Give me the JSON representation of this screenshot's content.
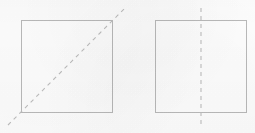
{
  "figure": {
    "caption": "",
    "canvas": {
      "width": 255,
      "height": 133,
      "background_color": "#fdfdfd"
    },
    "style": {
      "shape_stroke_color": "#b9b9b9",
      "shape_stroke_width": 1,
      "symmetry_stroke_color": "#bdbdbd",
      "symmetry_stroke_width": 1.1,
      "dash_length": 4,
      "gap_length": 4
    },
    "shapes": [
      {
        "id": "left-square",
        "name": "square",
        "label": "",
        "x": 21,
        "y": 20,
        "width": 91,
        "height": 92,
        "symmetry_line": {
          "id": "left-diagonal-symmetry-line",
          "type": "diagonal",
          "orientation": "bottom-left-to-top-right",
          "label": "",
          "x1": 8,
          "y1": 125,
          "x2": 125,
          "y2": 8
        }
      },
      {
        "id": "right-square",
        "name": "square",
        "label": "",
        "x": 155,
        "y": 20,
        "width": 91,
        "height": 92,
        "symmetry_line": {
          "id": "right-vertical-symmetry-line",
          "type": "vertical",
          "orientation": "top-to-bottom",
          "label": "",
          "x1": 201,
          "y1": 8,
          "x2": 201,
          "y2": 125
        }
      }
    ]
  }
}
